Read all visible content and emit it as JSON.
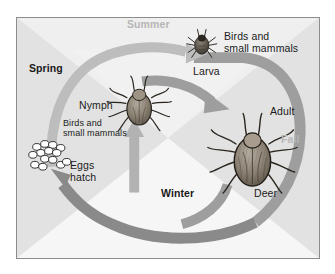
{
  "diagram": {
    "frame": {
      "border_color": "#8d8d8d",
      "background_color": "#e9e9e9"
    }
  },
  "seasons": [
    {
      "id": "spring",
      "label": "Spring",
      "style": "dark",
      "color": "#1a1a1a",
      "x": 28,
      "y": 62
    },
    {
      "id": "summer",
      "label": "Summer",
      "style": "light",
      "color": "#b6b6b6",
      "x": 126,
      "y": 17
    },
    {
      "id": "fall",
      "label": "Fall",
      "style": "light",
      "color": "#b6b6b6",
      "x": 281,
      "y": 132
    },
    {
      "id": "winter",
      "label": "Winter",
      "style": "dark",
      "color": "#1a1a1a",
      "x": 160,
      "y": 186
    }
  ],
  "stages": [
    {
      "id": "larva",
      "label": "Larva",
      "host": "Birds and\nsmall mammals"
    },
    {
      "id": "nymph",
      "label": "Nymph",
      "host": "Birds and\nsmall mammals"
    },
    {
      "id": "adult",
      "label": "Adult",
      "host": "Deer"
    },
    {
      "id": "eggs",
      "label": "Eggs\nhatch",
      "host": ""
    }
  ],
  "labels": {
    "larva": "Larva",
    "larva_host": "Birds and\nsmall mammals",
    "nymph": "Nymph",
    "nymph_host": "Birds and\nsmall mammals",
    "adult": "Adult",
    "adult_host": "Deer",
    "eggs": "Eggs\nhatch"
  },
  "arrows": [
    {
      "id": "eggs-to-larva",
      "from": "eggs",
      "to": "larva",
      "season": "summer",
      "color": "#b9b9b9"
    },
    {
      "id": "larva-to-adult",
      "from": "larva",
      "to": "adult",
      "season": "fall",
      "color": "#9a9a9a"
    },
    {
      "id": "adult-to-eggs",
      "from": "adult",
      "to": "eggs",
      "season": "winter",
      "color": "#8a8a8a"
    },
    {
      "id": "eggs-to-nymph",
      "from": "eggs",
      "to": "nymph",
      "season": "spring",
      "color": "#b2b2b2"
    }
  ],
  "colors": {
    "background": "#e9e9e9",
    "wedge_light": "#f4f4f4",
    "wedge_dark": "#dcdcdc",
    "arrow_light": "#b9b9b9",
    "arrow_mid": "#9a9a9a",
    "arrow_dark": "#8a8a8a",
    "tick_body": "#7d7468",
    "text_dark": "#1a1a1a",
    "text_light": "#b6b6b6"
  }
}
